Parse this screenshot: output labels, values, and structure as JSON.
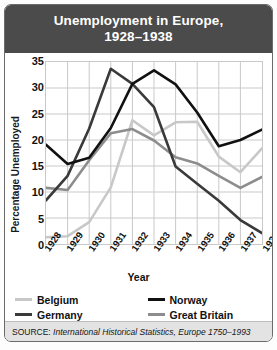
{
  "title_line1": "Unemployment in Europe,",
  "title_line2": "1928–1938",
  "title_full": "Unemployment in Europe, 1928–1938",
  "source": {
    "prefix": "SOURCE: ",
    "citation": "International Historical Statistics, Europe 1750–1993",
    "full": "SOURCE: International Historical Statistics, Europe 1750–1993"
  },
  "legend": {
    "position": "bottom",
    "entries": [
      {
        "label": "Belgium",
        "color": "#c8c8c8"
      },
      {
        "label": "Norway",
        "color": "#111111"
      },
      {
        "label": "Germany",
        "color": "#3a3a3a"
      },
      {
        "label": "Great Britain",
        "color": "#8d8d8d"
      }
    ]
  },
  "colors": {
    "header_bg": "#4b4b4b",
    "header_text": "#ffffff",
    "grid": "#c9c9c9",
    "source_bg": "#e3e3e3",
    "frame": "#6b6b6b"
  },
  "chart_data": {
    "type": "line",
    "xlabel": "Year",
    "ylabel": "Percentage Unemployed",
    "grid": true,
    "legend_position": "bottom",
    "categories": [
      "1928",
      "1929",
      "1930",
      "1931",
      "1932",
      "1933",
      "1934",
      "1935",
      "1936",
      "1937",
      "1938"
    ],
    "xticklabels": [
      "1928",
      "1929",
      "1930",
      "1931",
      "1932",
      "1933",
      "1934",
      "1935",
      "1936",
      "1937",
      "1938"
    ],
    "yticks": [
      0,
      5,
      10,
      15,
      20,
      25,
      30,
      35
    ],
    "yticklabels": [
      "0",
      "5",
      "10",
      "15",
      "20",
      "25",
      "30",
      "35"
    ],
    "ylim": [
      0,
      35
    ],
    "xlim": [
      "1928",
      "1938"
    ],
    "series": [
      {
        "name": "Belgium",
        "color": "#c8c8c8",
        "values": [
          1.3,
          1.5,
          4.2,
          10.9,
          23.8,
          20.9,
          23.4,
          23.5,
          16.8,
          13.8,
          18.4
        ]
      },
      {
        "name": "Germany",
        "color": "#3a3a3a",
        "values": [
          8.4,
          13.1,
          22.2,
          33.7,
          30.8,
          26.3,
          14.9,
          11.6,
          8.3,
          4.6,
          2.1
        ]
      },
      {
        "name": "Norway",
        "color": "#111111",
        "values": [
          19.1,
          15.4,
          16.6,
          22.3,
          30.8,
          33.4,
          30.7,
          25.3,
          18.8,
          20.0,
          22.0
        ]
      },
      {
        "name": "Great Britain",
        "color": "#8d8d8d",
        "values": [
          10.8,
          10.4,
          16.1,
          21.3,
          22.1,
          19.9,
          16.7,
          15.5,
          13.1,
          10.8,
          12.9
        ]
      }
    ]
  }
}
